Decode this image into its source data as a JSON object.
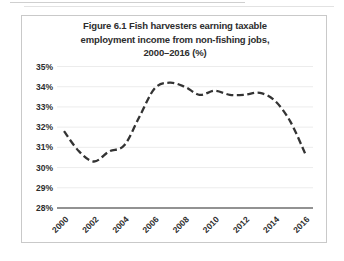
{
  "figure": {
    "title_line1": "Figure 6.1 Fish harvesters earning taxable",
    "title_line2": "employment income from non-fishing jobs,",
    "title_line3": "2000–2016 (%)"
  },
  "chart_data": {
    "type": "line",
    "title": "Figure 6.1 Fish harvesters earning taxable employment income from non-fishing jobs, 2000–2016 (%)",
    "series_name": "Fish harvesters earning taxable employment income from non-fishing jobs (%)",
    "x": [
      2000,
      2001,
      2002,
      2003,
      2004,
      2005,
      2006,
      2007,
      2008,
      2009,
      2010,
      2011,
      2012,
      2013,
      2014,
      2015,
      2016
    ],
    "values": [
      31.8,
      30.8,
      30.3,
      30.8,
      31.1,
      32.5,
      33.9,
      34.2,
      34.0,
      33.6,
      33.8,
      33.6,
      33.6,
      33.7,
      33.3,
      32.3,
      30.7
    ],
    "x_tick_labels": [
      "2000",
      "2002",
      "2004",
      "2006",
      "2008",
      "2010",
      "2012",
      "2014",
      "2016"
    ],
    "y_tick_labels": [
      "35%",
      "34%",
      "33%",
      "32%",
      "31%",
      "30%",
      "29%",
      "28%"
    ],
    "xlim": [
      2000,
      2016
    ],
    "ylim": [
      28,
      35
    ],
    "y_tick_step": 1,
    "grid": "horizontal-faint",
    "legend": "none",
    "line_style": "dashed",
    "line_color": "#333333",
    "grid_color": "#ececec",
    "axis_color": "#6e6e6e",
    "text_color": "#2d2d2d"
  }
}
